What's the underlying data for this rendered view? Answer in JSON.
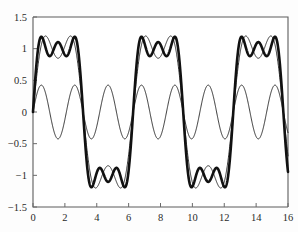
{
  "chart_data": {
    "type": "line",
    "title": "",
    "xlabel": "",
    "ylabel": "",
    "xlim": [
      0,
      16
    ],
    "ylim": [
      -1.5,
      1.5
    ],
    "grid": false,
    "legend": "none",
    "xticks": [
      0,
      2,
      4,
      6,
      8,
      10,
      12,
      14,
      16
    ],
    "xtick_labels": [
      "0",
      "2",
      "4",
      "6",
      "8",
      "10",
      "12",
      "14",
      "16"
    ],
    "yticks": [
      -1.5,
      -1,
      -0.5,
      0,
      0.5,
      1,
      1.5
    ],
    "ytick_labels": [
      "-1.5",
      "-1",
      "-0.5",
      "0",
      "0.5",
      "1",
      "1.5"
    ],
    "series": [
      {
        "name": "third-harmonic",
        "style": "thin",
        "linewidth": 0.85,
        "color": "#111111",
        "terms": [
          {
            "amplitude": 0.4244,
            "frequency": 3,
            "phase": 0
          }
        ],
        "base_period": 6.2832,
        "peak_value": 0.42,
        "trough_value": -0.42,
        "cycles_visible": 8
      },
      {
        "name": "two-term-partial-sum",
        "style": "thin",
        "linewidth": 0.95,
        "color": "#111111",
        "terms": [
          {
            "amplitude": 1.2732,
            "frequency": 1,
            "phase": 0
          },
          {
            "amplitude": 0.4244,
            "frequency": 3,
            "phase": 0
          }
        ],
        "base_period": 6.2832,
        "peak_value": 1.27,
        "trough_value": -1.27,
        "cycles_visible": 2.5
      },
      {
        "name": "three-term-partial-sum",
        "style": "thick",
        "linewidth": 2.6,
        "color": "#111111",
        "terms": [
          {
            "amplitude": 1.2732,
            "frequency": 1,
            "phase": 0
          },
          {
            "amplitude": 0.4244,
            "frequency": 3,
            "phase": 0
          },
          {
            "amplitude": 0.2546,
            "frequency": 5,
            "phase": 0
          }
        ],
        "base_period": 6.2832,
        "peak_value": 1.22,
        "local_min_at_peak": 0.92,
        "trough_value": -1.22,
        "local_max_at_trough": -0.92,
        "cycles_visible": 2.5
      }
    ],
    "samples": 1400
  },
  "figure": {
    "background_color": "#ffffff",
    "axis_color": "#5d5d5d",
    "curve_color": "#111111"
  }
}
